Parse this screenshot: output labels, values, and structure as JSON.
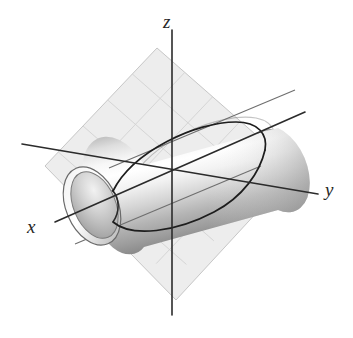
{
  "figure": {
    "background_color": "#ffffff"
  },
  "axes": {
    "labels": {
      "x": "x",
      "y": "y",
      "z": "z"
    },
    "color": "#2b2b2b",
    "line_width": 1.6,
    "origin": {
      "x": 172,
      "y": 172
    },
    "segments": [
      {
        "name": "z-axis",
        "x1": 172,
        "y1": 30,
        "x2": 172,
        "y2": 315
      },
      {
        "name": "y-axis",
        "x1": 22,
        "y1": 144,
        "x2": 318,
        "y2": 194
      },
      {
        "name": "x-axis",
        "x1": 55,
        "y1": 222,
        "x2": 305,
        "y2": 112
      }
    ]
  },
  "plane": {
    "name": "cutting-plane",
    "fill_color": "#e9e9e9",
    "edge_color": "#b8b8b8",
    "grid_color": "#c9c9c9",
    "grid_divisions": 5,
    "opacity": 0.78,
    "vertices": [
      {
        "x": 157,
        "y": 48
      },
      {
        "x": 296,
        "y": 170
      },
      {
        "x": 176,
        "y": 300
      },
      {
        "x": 45,
        "y": 166
      }
    ]
  },
  "cylinder": {
    "name": "circular-cylinder",
    "body_color_light": "#fdfdfd",
    "body_color_mid": "#d8d8d8",
    "body_color_dark": "#9a9a9a",
    "outline_color": "#5a5a5a",
    "axis_start": {
      "x": 92,
      "y": 206
    },
    "axis_end": {
      "x": 278,
      "y": 128
    },
    "radius_x": 26,
    "radius_y": 41,
    "cap_open": true,
    "cap_interior_color": "#b6b6b6"
  },
  "intersection_curve": {
    "name": "ellipse-of-intersection",
    "color": "#1c1c1c",
    "line_width": 1.8,
    "closed": true,
    "description": "Ellipse formed where the oblique plane meets the cylinder"
  }
}
